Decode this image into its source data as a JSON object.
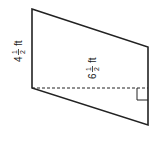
{
  "figure": {
    "shape": "parallelogram",
    "side_label": {
      "whole": "4",
      "numerator": "1",
      "denominator": "2",
      "unit": "ft"
    },
    "height_label": {
      "whole": "6",
      "numerator": "1",
      "denominator": "2",
      "unit": "ft"
    },
    "right_angle_marker": true,
    "height_line_style": "dashed",
    "stroke_color": "#222222"
  }
}
